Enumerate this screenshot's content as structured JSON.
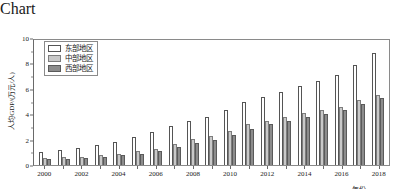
{
  "chart_data": {
    "type": "bar",
    "title": "",
    "xlabel": "年份",
    "ylabel": "人均GDP/(万元/人)",
    "ylim": [
      0,
      10
    ],
    "yticks": [
      0,
      2,
      4,
      6,
      8,
      10
    ],
    "ytick_labels": [
      "0",
      "2",
      "4",
      "6",
      "8",
      "10"
    ],
    "grid": false,
    "legend_position": "upper-left-inside",
    "categories": [
      "2000",
      "2001",
      "2002",
      "2003",
      "2004",
      "2005",
      "2006",
      "2007",
      "2008",
      "2009",
      "2010",
      "2011",
      "2012",
      "2013",
      "2014",
      "2015",
      "2016",
      "2017",
      "2018"
    ],
    "xtick_labels": [
      "2000",
      "2002",
      "2004",
      "2006",
      "2008",
      "2010",
      "2012",
      "2014",
      "2016",
      "2018"
    ],
    "series": [
      {
        "name": "东部地区",
        "color": "#ffffff",
        "edge_color": "#555555",
        "values": [
          1.05,
          1.2,
          1.35,
          1.55,
          1.85,
          2.2,
          2.6,
          3.05,
          3.5,
          3.75,
          4.35,
          4.95,
          5.35,
          5.75,
          6.2,
          6.6,
          7.1,
          7.85,
          8.8
        ]
      },
      {
        "name": "中部地区",
        "color": "#c9c9c9",
        "edge_color": "#7d7d7d",
        "values": [
          0.55,
          0.6,
          0.65,
          0.75,
          0.9,
          1.1,
          1.3,
          1.65,
          2.05,
          2.25,
          2.7,
          3.2,
          3.5,
          3.8,
          4.1,
          4.3,
          4.6,
          5.1,
          5.5
        ]
      },
      {
        "name": "西部地区",
        "color": "#8c8c8c",
        "edge_color": "#5a5a5a",
        "values": [
          0.45,
          0.5,
          0.55,
          0.65,
          0.75,
          0.9,
          1.1,
          1.4,
          1.75,
          1.95,
          2.35,
          2.85,
          3.2,
          3.5,
          3.8,
          4.0,
          4.3,
          4.8,
          5.25
        ]
      }
    ]
  },
  "legend": {
    "items": [
      {
        "label": "东部地区",
        "swatch": "east"
      },
      {
        "label": "中部地区",
        "swatch": "central"
      },
      {
        "label": "西部地区",
        "swatch": "west"
      }
    ]
  }
}
